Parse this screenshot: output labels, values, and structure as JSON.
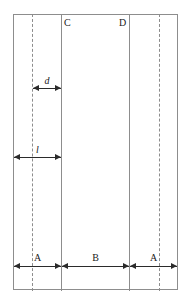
{
  "diagram": {
    "background_color": "#ffffff",
    "line_color": "#8d8d8d",
    "arrow_color": "#2b2b2b",
    "text_color": "#1a1a1a",
    "top_labels": [
      {
        "id": "c",
        "text": "C"
      },
      {
        "id": "d",
        "text": "D"
      }
    ],
    "dimensions": [
      {
        "id": "d",
        "label": "d",
        "italic": true,
        "position": "upper-left",
        "from": "left-dashed-line",
        "to": "line-C"
      },
      {
        "id": "l",
        "label": "l",
        "italic": true,
        "position": "middle-left",
        "from": "frame-left-edge",
        "to": "line-C"
      },
      {
        "id": "a1",
        "label": "A",
        "italic": false,
        "position": "bottom-left",
        "from": "frame-left-edge",
        "to": "line-C"
      },
      {
        "id": "b",
        "label": "B",
        "italic": false,
        "position": "bottom-center",
        "from": "line-C",
        "to": "line-D"
      },
      {
        "id": "a2",
        "label": "A",
        "italic": false,
        "position": "bottom-right",
        "from": "line-D",
        "to": "frame-right-edge"
      }
    ],
    "vertical_solid_lines": [
      {
        "id": "line-C",
        "x": 61
      },
      {
        "id": "line-D",
        "x": 129
      }
    ],
    "vertical_dashed_lines": [
      {
        "id": "dashed-left",
        "x": 32
      },
      {
        "id": "dashed-right",
        "x": 159
      }
    ],
    "frame": {
      "x": 13,
      "y": 14,
      "width": 165,
      "height": 276
    }
  }
}
